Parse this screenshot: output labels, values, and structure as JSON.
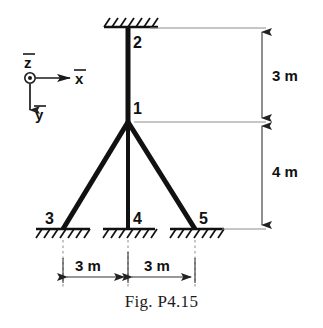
{
  "figure": {
    "caption": "Fig. P4.15",
    "nodes": [
      {
        "id": "1",
        "label": "1",
        "x": 128,
        "y": 122,
        "label_x": 133,
        "label_y": 114
      },
      {
        "id": "2",
        "label": "2",
        "x": 128,
        "y": 28,
        "label_x": 133,
        "label_y": 48
      },
      {
        "id": "3",
        "label": "3",
        "x": 63,
        "y": 229,
        "label_x": 47,
        "label_y": 223
      },
      {
        "id": "4",
        "label": "4",
        "x": 128,
        "y": 229,
        "label_x": 133,
        "label_y": 223
      },
      {
        "id": "5",
        "label": "5",
        "x": 195,
        "y": 229,
        "label_x": 200,
        "label_y": 223
      }
    ],
    "members": [
      {
        "name": "column-upper",
        "from": "2",
        "to": "1"
      },
      {
        "name": "column-lower",
        "from": "1",
        "to": "4"
      },
      {
        "name": "brace-left",
        "from": "1",
        "to": "3"
      },
      {
        "name": "brace-right",
        "from": "1",
        "to": "5"
      }
    ],
    "supports": [
      {
        "name": "support-2",
        "node": "2",
        "x": 128,
        "y": 27,
        "orientation": "ceiling"
      },
      {
        "name": "support-3",
        "node": "3",
        "x": 63,
        "y": 229,
        "orientation": "ground"
      },
      {
        "name": "support-4",
        "node": "4",
        "x": 128,
        "y": 229,
        "orientation": "ground"
      },
      {
        "name": "support-5",
        "node": "5",
        "x": 195,
        "y": 229,
        "orientation": "ground"
      }
    ],
    "dimensions": [
      {
        "name": "vertical-3m",
        "label": "3 m",
        "orientation": "vertical",
        "from_y": 28,
        "to_y": 122,
        "line_x": 262,
        "label_x": 272,
        "label_y": 80
      },
      {
        "name": "vertical-4m",
        "label": "4 m",
        "orientation": "vertical",
        "from_y": 122,
        "to_y": 229,
        "line_x": 262,
        "label_x": 272,
        "label_y": 172
      },
      {
        "name": "horizontal-left-3m",
        "label": "3 m",
        "orientation": "horizontal",
        "from_x": 63,
        "to_x": 128,
        "line_y": 277,
        "label_x": 95,
        "label_y": 269
      },
      {
        "name": "horizontal-right-3m",
        "label": "3 m",
        "orientation": "horizontal",
        "from_x": 128,
        "to_x": 195,
        "line_y": 277,
        "label_x": 162,
        "label_y": 269
      }
    ],
    "axes": {
      "origin_x": 30,
      "origin_y": 78,
      "z": {
        "label": "z",
        "overbar": true,
        "type": "out-of-page",
        "label_x": 26,
        "label_y": 66
      },
      "x": {
        "label": "x",
        "overbar": true,
        "direction": "right",
        "tip_x": 72,
        "label_x": 76,
        "label_y": 82
      },
      "y": {
        "label": "y",
        "overbar": true,
        "direction": "down",
        "tip_y": 112,
        "label_x": 36,
        "label_y": 118
      }
    },
    "colors": {
      "member": "#111111",
      "dimension": "#4d4d4d",
      "extension": "#8c8c8c",
      "background": "#ffffff",
      "text": "#111111"
    }
  }
}
